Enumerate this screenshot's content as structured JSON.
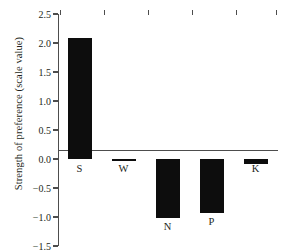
{
  "chart_data": {
    "type": "bar",
    "title": "",
    "subtitle": "",
    "xlabel": "",
    "ylabel": "Strength of preference (scale value)",
    "categories": [
      "S",
      "W",
      "N",
      "P",
      "K"
    ],
    "values": [
      2.08,
      -0.04,
      -1.01,
      -0.93,
      -0.08
    ],
    "series": [
      {
        "name": "Strength of preference",
        "values": [
          2.08,
          -0.04,
          -1.01,
          -0.93,
          -0.08
        ]
      }
    ],
    "ylim": [
      -1.5,
      2.5
    ],
    "ytick_values": [
      2.5,
      2.0,
      1.5,
      1.0,
      0.5,
      0.0,
      -0.5,
      -1.0,
      -1.5
    ],
    "ytick_labels": [
      "2.5",
      "2.0",
      "1.5",
      "1.0",
      "0.5",
      "0.0",
      "−0.5",
      "−1.0",
      "−1.5"
    ],
    "grid": false,
    "legend": "none",
    "bar_color": "#0d0d0d",
    "axis_color": "#4d4d4d",
    "background_color": "#ffffff",
    "annotations": []
  }
}
